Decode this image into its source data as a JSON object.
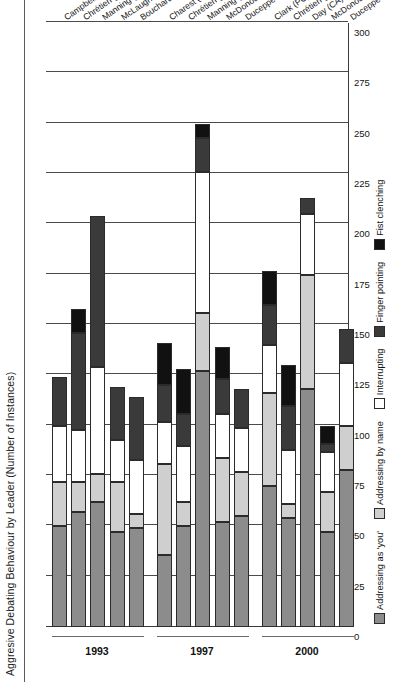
{
  "chart_data": {
    "type": "bar",
    "orientation": "horizontal-stacked",
    "title": "Aggresive Debating Behaviour by Leader (Number of Instances)",
    "xlabel": "",
    "ylabel": "",
    "xlim": [
      0,
      300
    ],
    "xticks": [
      0,
      25,
      50,
      75,
      100,
      125,
      150,
      175,
      200,
      225,
      250,
      275,
      300
    ],
    "xtick_labels": [
      "0",
      "25",
      "50",
      "75",
      "100",
      "125",
      "150",
      "175",
      "200",
      "225",
      "250",
      "275",
      "300"
    ],
    "grid": true,
    "legend_position": "bottom-left",
    "series": [
      {
        "name": "Addressing as 'you'",
        "color": "#8c8c8c"
      },
      {
        "name": "Addressing by name",
        "color": "#cfcfcf"
      },
      {
        "name": "Interrupting",
        "color": "#ffffff"
      },
      {
        "name": "Finger pointing",
        "color": "#3a3a3a"
      },
      {
        "name": "Fist clenching",
        "color": "#111111"
      }
    ],
    "groups": [
      {
        "label": "1993",
        "categories": [
          {
            "label": "Campbell (PC)",
            "values": [
              50,
              22,
              28,
              24,
              0
            ]
          },
          {
            "label": "Chrétien (Lib.)",
            "values": [
              57,
              15,
              26,
              48,
              12
            ]
          },
          {
            "label": "Manning (Ref.)",
            "values": [
              62,
              14,
              53,
              75,
              0
            ]
          },
          {
            "label": "McLaughlin (NDP)",
            "values": [
              47,
              25,
              21,
              26,
              0
            ]
          },
          {
            "label": "Bouchard (BQ)",
            "values": [
              49,
              7,
              27,
              31,
              0
            ]
          }
        ]
      },
      {
        "label": "1997",
        "categories": [
          {
            "label": "Charest (PC)",
            "values": [
              36,
              45,
              21,
              18,
              21
            ]
          },
          {
            "label": "Chrétien (Lib.)",
            "values": [
              50,
              12,
              28,
              16,
              22
            ]
          },
          {
            "label": "Manning (Ref.)",
            "values": [
              127,
              29,
              70,
              17,
              7
            ]
          },
          {
            "label": "McDonough (NDP)",
            "values": [
              52,
              32,
              22,
              17,
              16
            ]
          },
          {
            "label": "Duceppe (BQ)",
            "values": [
              55,
              22,
              22,
              19,
              0
            ]
          }
        ]
      },
      {
        "label": "2000",
        "categories": [
          {
            "label": "Clark (PC)",
            "values": [
              70,
              46,
              24,
              20,
              17
            ]
          },
          {
            "label": "Chrétien (Lib.)",
            "values": [
              54,
              7,
              27,
              22,
              20
            ]
          },
          {
            "label": "Day (CA)",
            "values": [
              118,
              57,
              30,
              8,
              0
            ]
          },
          {
            "label": "McDonough (NDP)",
            "values": [
              47,
              20,
              20,
              4,
              9
            ]
          },
          {
            "label": "Duceppe (BQ)",
            "values": [
              78,
              22,
              31,
              17,
              0
            ]
          }
        ]
      }
    ]
  },
  "legend": {
    "items": [
      {
        "label": "Addressing as 'you'",
        "swatch": "#8c8c8c"
      },
      {
        "label": "Addressing by name",
        "swatch": "#cfcfcf"
      },
      {
        "label": "Interrupting",
        "swatch": "#ffffff"
      },
      {
        "label": "Finger pointing",
        "swatch": "#3a3a3a"
      },
      {
        "label": "Fist clenching",
        "swatch": "#111111"
      }
    ]
  }
}
